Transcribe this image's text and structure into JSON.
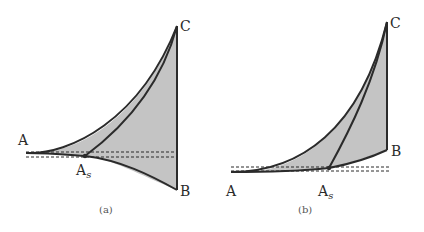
{
  "figure": {
    "panels": [
      {
        "caption": "(a)",
        "labels": {
          "A": "A",
          "As_base": "A",
          "As_sub": "s",
          "B": "B",
          "C": "C"
        }
      },
      {
        "caption": "(b)",
        "labels": {
          "A": "A",
          "As_base": "A",
          "As_sub": "s",
          "B": "B",
          "C": "C"
        }
      }
    ],
    "colors": {
      "fill": "#c4c4c4",
      "stroke": "#2b2b2b",
      "dash": "#2b2b2b"
    }
  }
}
